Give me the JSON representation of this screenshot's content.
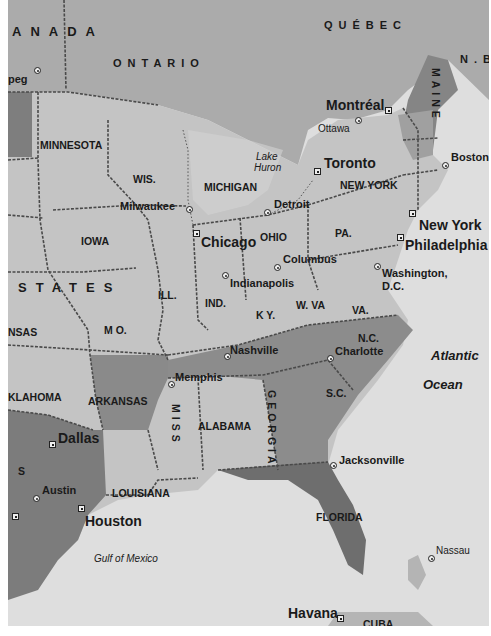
{
  "map": {
    "colors": {
      "land_light": "#c6c6c6",
      "land_mid": "#9a9a9a",
      "land_dark": "#7a7a7a",
      "canada": "#a8a8a8",
      "water": "#dedede",
      "border": "#4a4a4a"
    },
    "countries": [
      {
        "label": "ANADA",
        "x": 4,
        "y": 25
      },
      {
        "label": "STATES",
        "x": 10,
        "y": 281
      }
    ],
    "provinces": [
      {
        "label": "ONTARIO",
        "x": 105,
        "y": 58
      },
      {
        "label": "QUÉBEC",
        "x": 316,
        "y": 20
      },
      {
        "label": "N.B.",
        "x": 452,
        "y": 54
      }
    ],
    "states": [
      {
        "label": "MINNESOTA",
        "x": 32,
        "y": 140
      },
      {
        "label": "WIS.",
        "x": 125,
        "y": 174
      },
      {
        "label": "MICHIGAN",
        "x": 196,
        "y": 182
      },
      {
        "label": "IOWA",
        "x": 73,
        "y": 236
      },
      {
        "label": "ILL.",
        "x": 150,
        "y": 290
      },
      {
        "label": "IND.",
        "x": 197,
        "y": 298
      },
      {
        "label": "OHIO",
        "x": 252,
        "y": 232
      },
      {
        "label": "PA.",
        "x": 327,
        "y": 228
      },
      {
        "label": "NEW YORK",
        "x": 332,
        "y": 180
      },
      {
        "label": "K Y.",
        "x": 248,
        "y": 310
      },
      {
        "label": "W. VA",
        "x": 288,
        "y": 300
      },
      {
        "label": "VA.",
        "x": 344,
        "y": 305
      },
      {
        "label": "M O.",
        "x": 96,
        "y": 325
      },
      {
        "label": "NSAS",
        "x": 0,
        "y": 327
      },
      {
        "label": "KLAHOMA",
        "x": 0,
        "y": 392
      },
      {
        "label": "ARKANSAS",
        "x": 80,
        "y": 396
      },
      {
        "label": "ALABAMA",
        "x": 190,
        "y": 421
      },
      {
        "label": "N.C.",
        "x": 350,
        "y": 333
      },
      {
        "label": "S.C.",
        "x": 318,
        "y": 388
      },
      {
        "label": "LOUISIANA",
        "x": 104,
        "y": 488
      },
      {
        "label": "FLORIDA",
        "x": 308,
        "y": 512
      },
      {
        "label": "S",
        "x": 10,
        "y": 466
      }
    ],
    "vertical_states": [
      {
        "label": "MAINE",
        "x": 422,
        "y": 68
      },
      {
        "label": "GEORGIA",
        "x": 258,
        "y": 390
      },
      {
        "label": "MISS",
        "x": 162,
        "y": 404
      }
    ],
    "cities": [
      {
        "label": "peg",
        "x": 0,
        "y": 74,
        "mx": 26,
        "my": 67,
        "type": "dot",
        "size": "city"
      },
      {
        "label": "Montréal",
        "x": 318,
        "y": 98,
        "mx": 377,
        "my": 107,
        "type": "sq",
        "size": "city-big"
      },
      {
        "label": "Ottawa",
        "x": 310,
        "y": 124,
        "mx": 347,
        "my": 117,
        "type": "dot",
        "size": "city-light"
      },
      {
        "label": "Toronto",
        "x": 316,
        "y": 156,
        "mx": 306,
        "my": 168,
        "type": "sq",
        "size": "city-big"
      },
      {
        "label": "Boston",
        "x": 443,
        "y": 152,
        "mx": 434,
        "my": 162,
        "type": "dot",
        "size": "city"
      },
      {
        "label": "Detroit",
        "x": 266,
        "y": 199,
        "mx": 256,
        "my": 209,
        "type": "dot",
        "size": "city"
      },
      {
        "label": "Milwaukee",
        "x": 112,
        "y": 201,
        "mx": 178,
        "my": 206,
        "type": "dot",
        "size": "city"
      },
      {
        "label": "Chicago",
        "x": 193,
        "y": 235,
        "mx": 185,
        "my": 230,
        "type": "sq",
        "size": "city-big"
      },
      {
        "label": "New York",
        "x": 411,
        "y": 218,
        "mx": 401,
        "my": 210,
        "type": "sq",
        "size": "city-big"
      },
      {
        "label": "Philadelphia",
        "x": 397,
        "y": 238,
        "mx": 389,
        "my": 234,
        "type": "sq",
        "size": "city-big"
      },
      {
        "label": "Columbus",
        "x": 275,
        "y": 254,
        "mx": 266,
        "my": 264,
        "type": "dot",
        "size": "city"
      },
      {
        "label": "Indianapolis",
        "x": 222,
        "y": 278,
        "mx": 214,
        "my": 272,
        "type": "dot",
        "size": "city"
      },
      {
        "label": "Washington,",
        "x": 374,
        "y": 268,
        "mx": 366,
        "my": 263,
        "type": "dot",
        "size": "city"
      },
      {
        "label": "D.C.",
        "x": 374,
        "y": 281,
        "mx": null,
        "my": null,
        "type": "none",
        "size": "city"
      },
      {
        "label": "Nashville",
        "x": 222,
        "y": 345,
        "mx": 216,
        "my": 353,
        "type": "dot",
        "size": "city"
      },
      {
        "label": "Charlotte",
        "x": 327,
        "y": 346,
        "mx": 319,
        "my": 355,
        "type": "dot",
        "size": "city"
      },
      {
        "label": "Memphis",
        "x": 167,
        "y": 372,
        "mx": 160,
        "my": 381,
        "type": "dot",
        "size": "city"
      },
      {
        "label": "Dallas",
        "x": 50,
        "y": 431,
        "mx": 41,
        "my": 441,
        "type": "sq",
        "size": "city-big"
      },
      {
        "label": "Jacksonville",
        "x": 331,
        "y": 455,
        "mx": 322,
        "my": 462,
        "type": "dot",
        "size": "city"
      },
      {
        "label": "Austin",
        "x": 34,
        "y": 485,
        "mx": 25,
        "my": 495,
        "type": "dot",
        "size": "city"
      },
      {
        "label": "Houston",
        "x": 77,
        "y": 514,
        "mx": 70,
        "my": 505,
        "type": "sq",
        "size": "city-big"
      },
      {
        "label": "",
        "x": 0,
        "y": 0,
        "mx": 4,
        "my": 513,
        "type": "sq",
        "size": "city"
      },
      {
        "label": "Nassau",
        "x": 428,
        "y": 546,
        "mx": 420,
        "my": 555,
        "type": "dot",
        "size": "city-light"
      },
      {
        "label": "Havana",
        "x": 280,
        "y": 606,
        "mx": 329,
        "my": 615,
        "type": "sq",
        "size": "city-big"
      }
    ],
    "water": [
      {
        "label": "Lake",
        "x": 248,
        "y": 152,
        "cls": "city-light"
      },
      {
        "label": "Huron",
        "x": 246,
        "y": 163,
        "cls": "city-light"
      },
      {
        "label": "Atlantic",
        "x": 423,
        "y": 349,
        "cls": "ocean"
      },
      {
        "label": "Ocean",
        "x": 415,
        "y": 378,
        "cls": "ocean"
      },
      {
        "label": "Gulf of Mexico",
        "x": 86,
        "y": 554,
        "cls": "city-light"
      }
    ],
    "cuba_label": "CUBA"
  }
}
